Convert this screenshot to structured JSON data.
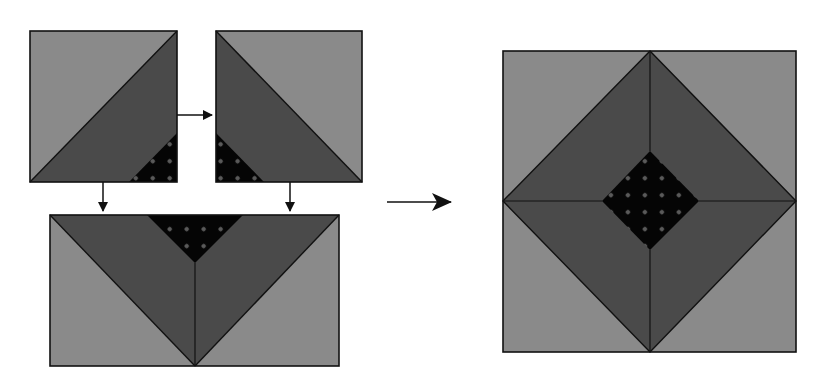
{
  "figure": {
    "colors": {
      "background": "#ffffff",
      "light_fabric": "#8a8a8a",
      "medium_fabric": "#4a4a4a",
      "dark_fabric": "#050505",
      "dot": "#5a5a5a",
      "seam_line": "#111111",
      "arrow": "#111111"
    },
    "units": [
      {
        "id": "unit-a",
        "label": "Half-square triangle unit A",
        "x": 30,
        "y": 31,
        "w": 147,
        "h": 151
      },
      {
        "id": "unit-b",
        "label": "Half-square triangle unit B",
        "x": 216,
        "y": 31,
        "w": 146,
        "h": 151
      },
      {
        "id": "unit-ab",
        "label": "Joined rectangle unit",
        "x": 50,
        "y": 215,
        "w": 289,
        "h": 151
      },
      {
        "id": "finished-block",
        "label": "Finished block",
        "x": 503,
        "y": 51,
        "w": 293,
        "h": 301
      }
    ],
    "arrows": [
      {
        "id": "arrow-a-to-b",
        "direction": "right"
      },
      {
        "id": "arrow-a-down",
        "direction": "down"
      },
      {
        "id": "arrow-b-down",
        "direction": "down"
      },
      {
        "id": "arrow-to-finished",
        "direction": "right"
      }
    ]
  }
}
